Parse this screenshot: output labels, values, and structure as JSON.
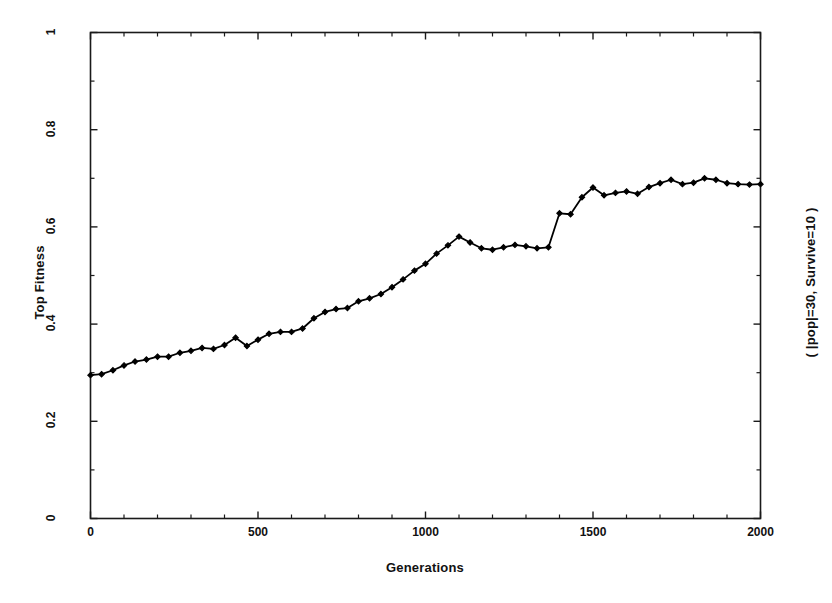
{
  "chart_data": {
    "type": "line",
    "title": "",
    "xlabel": "Generations",
    "ylabel": "Top Fitness",
    "annotation_right": "( |pop|=30, Survive=10 )",
    "xlim": [
      0,
      2000
    ],
    "ylim": [
      0,
      1
    ],
    "xticks": [
      0,
      500,
      1000,
      1500,
      2000
    ],
    "xtick_labels": [
      "0",
      "500",
      "1000",
      "1500",
      "2000"
    ],
    "yticks": [
      0,
      0.2,
      0.4,
      0.6,
      0.8,
      1
    ],
    "ytick_labels": [
      "0",
      "0.2",
      "0.4",
      "0.6",
      "0.8",
      "1"
    ],
    "x_minor_interval": 100,
    "y_minor_interval": 0.1,
    "grid": false,
    "legend": null,
    "series": [
      {
        "name": "Top Fitness",
        "color": "#000000",
        "marker": "filled-diamond",
        "x": [
          0,
          33,
          67,
          100,
          133,
          167,
          200,
          233,
          267,
          300,
          333,
          367,
          400,
          433,
          467,
          500,
          533,
          567,
          600,
          633,
          667,
          700,
          733,
          767,
          800,
          833,
          867,
          900,
          933,
          967,
          1000,
          1033,
          1067,
          1100,
          1133,
          1167,
          1200,
          1233,
          1267,
          1300,
          1333,
          1367,
          1400,
          1433,
          1467,
          1500,
          1533,
          1567,
          1600,
          1633,
          1667,
          1700,
          1733,
          1767,
          1800,
          1833,
          1867,
          1900,
          1933,
          1967,
          2000
        ],
        "y": [
          0.295,
          0.297,
          0.305,
          0.315,
          0.323,
          0.327,
          0.333,
          0.333,
          0.341,
          0.345,
          0.351,
          0.349,
          0.357,
          0.372,
          0.355,
          0.368,
          0.38,
          0.384,
          0.384,
          0.391,
          0.412,
          0.425,
          0.431,
          0.433,
          0.447,
          0.453,
          0.462,
          0.476,
          0.492,
          0.51,
          0.524,
          0.545,
          0.562,
          0.58,
          0.568,
          0.556,
          0.553,
          0.558,
          0.563,
          0.56,
          0.556,
          0.558,
          0.628,
          0.626,
          0.661,
          0.681,
          0.665,
          0.67,
          0.673,
          0.668,
          0.682,
          0.69,
          0.697,
          0.688,
          0.691,
          0.7,
          0.697,
          0.69,
          0.688,
          0.687,
          0.688
        ]
      }
    ]
  },
  "axes": {
    "y_title": "Top Fitness",
    "x_title": "Generations",
    "right_title": "( |pop|=30, Survive=10 )"
  }
}
